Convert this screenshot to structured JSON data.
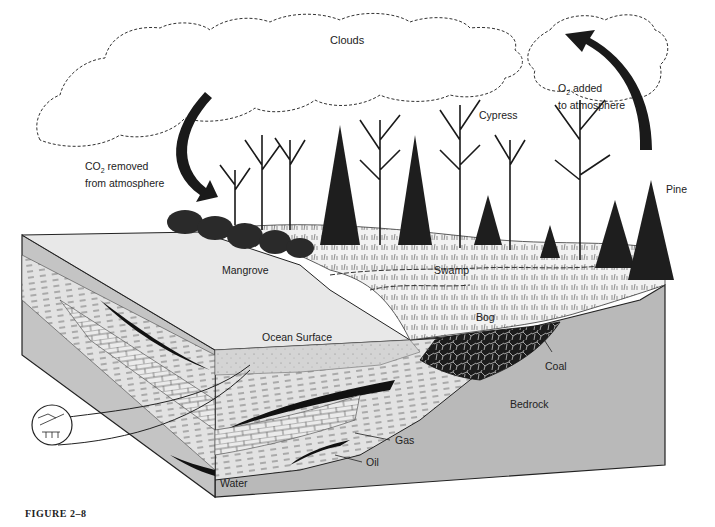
{
  "figure": {
    "caption": "FIGURE 2–8"
  },
  "labels": {
    "clouds": "Clouds",
    "co2_line1_pre": "CO",
    "co2_sub": "2",
    "co2_line1_post": " removed",
    "co2_line2": "from atmosphere",
    "o2_line1_pre": "O",
    "o2_sub": "2",
    "o2_line1_post": " added",
    "o2_line2": "to atmosphere",
    "cypress": "Cypress",
    "pine": "Pine",
    "mangrove": "Mangrove",
    "swamp": "Swamp",
    "bog": "Bog",
    "ocean_surface": "Ocean Surface",
    "coal": "Coal",
    "bedrock": "Bedrock",
    "gas": "Gas",
    "oil": "Oil",
    "water": "Water"
  },
  "colors": {
    "ink": "#1a1a1a",
    "bedrock": "#b9b9b9",
    "ocean_top": "#e6e6e6",
    "sediment": "#d8d8d8",
    "land": "#f0f0f0"
  }
}
